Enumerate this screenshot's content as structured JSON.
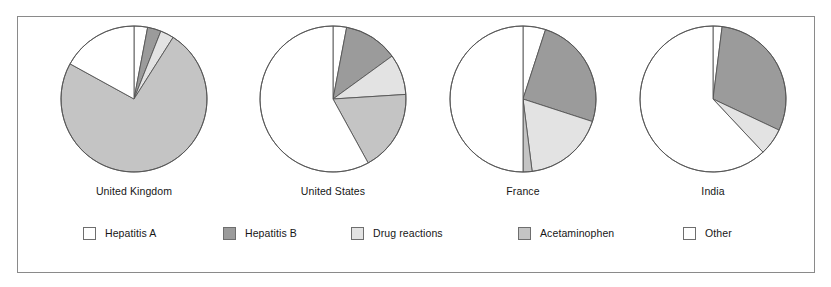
{
  "figure": {
    "title": "",
    "border_color": "#8a8a8a",
    "background": "#ffffff"
  },
  "legend": {
    "position": "bottom",
    "items": [
      {
        "label": "Hepatitis A",
        "color": "#ffffff",
        "key": "hepatitis_a"
      },
      {
        "label": "Hepatitis B",
        "color": "#9b9b9b",
        "key": "hepatitis_b"
      },
      {
        "label": "Drug reactions",
        "color": "#e3e3e3",
        "key": "drug_reactions"
      },
      {
        "label": "Acetaminophen",
        "color": "#c4c4c4",
        "key": "acetaminophen"
      },
      {
        "label": "Other",
        "color": "#ffffff",
        "key": "other"
      }
    ]
  },
  "chart_data": {
    "type": "pie",
    "title": "",
    "xlabel": "",
    "ylabel": "",
    "categories": [
      "Hepatitis A",
      "Hepatitis B",
      "Drug reactions",
      "Acetaminophen",
      "Other"
    ],
    "colors": [
      "#ffffff",
      "#9b9b9b",
      "#e3e3e3",
      "#c4c4c4",
      "#ffffff"
    ],
    "panels": [
      {
        "name": "United Kingdom",
        "values": [
          3,
          3,
          3,
          74,
          17
        ],
        "units": "percent"
      },
      {
        "name": "United States",
        "values": [
          3,
          12,
          9,
          18,
          58
        ],
        "units": "percent"
      },
      {
        "name": "France",
        "values": [
          5,
          25,
          18,
          2,
          50
        ],
        "units": "percent"
      },
      {
        "name": "India",
        "values": [
          2,
          30,
          6,
          0,
          62
        ],
        "units": "percent"
      }
    ]
  }
}
